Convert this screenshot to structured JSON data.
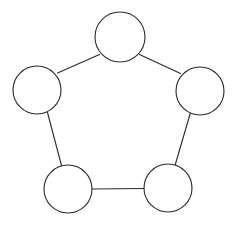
{
  "canvas": {
    "width": 236,
    "height": 229,
    "background_color": "#ffffff"
  },
  "style": {
    "node_stroke_color": "#2a2a2a",
    "node_fill_color": "#ffffff",
    "node_stroke_width": 1.1,
    "edge_color": "#2a2a2a",
    "edge_width": 1.1
  },
  "diagram": {
    "type": "undirected-graph",
    "shape": "cycle",
    "node_count": 5,
    "edge_count": 5,
    "nodes": [
      {
        "id": "top",
        "label": "",
        "cx": 120,
        "cy": 37,
        "r": 25
      },
      {
        "id": "right",
        "label": "",
        "cx": 200,
        "cy": 91,
        "r": 24
      },
      {
        "id": "bottom-right",
        "label": "",
        "cx": 168,
        "cy": 188,
        "r": 24
      },
      {
        "id": "bottom-left",
        "label": "",
        "cx": 68,
        "cy": 189,
        "r": 24
      },
      {
        "id": "left",
        "label": "",
        "cx": 37,
        "cy": 90,
        "r": 24
      }
    ],
    "edges": [
      {
        "id": "edge-top-right",
        "from": "top",
        "to": "right",
        "x1": 139.5,
        "y1": 54.5,
        "x2": 180.5,
        "y2": 73.5
      },
      {
        "id": "edge-right-bottomright",
        "from": "right",
        "to": "bottom-right",
        "x1": 190.5,
        "y1": 112.5,
        "x2": 175.0,
        "y2": 165.5
      },
      {
        "id": "edge-bottomright-bottomleft",
        "from": "bottom-right",
        "to": "bottom-left",
        "x1": 144.0,
        "y1": 188.5,
        "x2": 92.0,
        "y2": 189.0
      },
      {
        "id": "edge-bottomleft-left",
        "from": "bottom-left",
        "to": "left",
        "x1": 61.5,
        "y1": 165.5,
        "x2": 47.5,
        "y2": 112.5
      },
      {
        "id": "edge-left-top",
        "from": "left",
        "to": "top",
        "x1": 57.5,
        "y1": 73.0,
        "x2": 99.5,
        "y2": 54.5
      }
    ]
  }
}
